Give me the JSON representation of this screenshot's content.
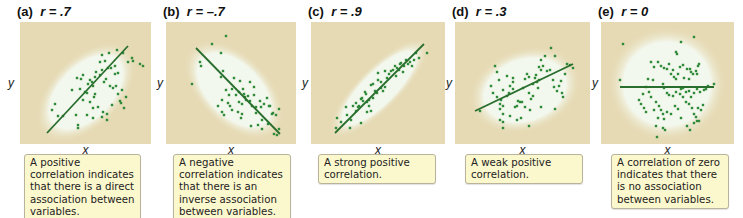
{
  "colors": {
    "plot_background": "#e6dab4",
    "cloud": "#f3f8ee",
    "points": "#2f8a3a",
    "line": "#2a6e2e",
    "caption_fill": "#fcf8cd",
    "caption_border": "#b8b39a"
  },
  "axis_labels": {
    "x": "x",
    "y": "y"
  },
  "chart_data": [
    {
      "type": "scatter",
      "title": "(a) r = .7",
      "panel_label": "(a)",
      "r_label": "r = .7",
      "xlabel": "x",
      "ylabel": "y",
      "grid": false,
      "caption": "A positive correlation indicates that there is a direct association between variables.",
      "trend_line": {
        "x1": 27,
        "y1": 111,
        "x2": 108,
        "y2": 24
      },
      "cloud": {
        "cx": 66,
        "cy": 70,
        "rx": 62,
        "ry": 36,
        "rotate": -45
      },
      "points": [
        [
          32,
          88
        ],
        [
          35,
          82
        ],
        [
          38,
          94
        ],
        [
          43,
          94
        ],
        [
          56,
          93
        ],
        [
          58,
          103
        ],
        [
          58,
          106
        ],
        [
          63,
          78
        ],
        [
          67,
          71
        ],
        [
          70,
          80
        ],
        [
          73,
          86
        ],
        [
          74,
          75
        ],
        [
          75,
          72
        ],
        [
          72,
          60
        ],
        [
          73,
          64
        ],
        [
          70,
          58
        ],
        [
          68,
          62
        ],
        [
          75,
          55
        ],
        [
          76,
          50
        ],
        [
          80,
          53
        ],
        [
          82,
          48
        ],
        [
          84,
          60
        ],
        [
          86,
          57
        ],
        [
          80,
          40
        ],
        [
          85,
          39
        ],
        [
          88,
          46
        ],
        [
          91,
          46
        ],
        [
          95,
          52
        ],
        [
          98,
          51
        ],
        [
          90,
          64
        ],
        [
          93,
          66
        ],
        [
          96,
          64
        ],
        [
          98,
          72
        ],
        [
          100,
          79
        ],
        [
          101,
          81
        ],
        [
          104,
          86
        ],
        [
          82,
          33
        ],
        [
          89,
          31
        ],
        [
          97,
          28
        ],
        [
          103,
          31
        ],
        [
          108,
          40
        ],
        [
          112,
          36
        ],
        [
          113,
          39
        ],
        [
          120,
          42
        ],
        [
          123,
          44
        ],
        [
          92,
          83
        ],
        [
          87,
          92
        ],
        [
          82,
          95
        ],
        [
          87,
          98
        ],
        [
          60,
          67
        ],
        [
          65,
          70
        ],
        [
          52,
          68
        ],
        [
          57,
          56
        ],
        [
          61,
          57
        ],
        [
          63,
          53
        ],
        [
          78,
          85
        ],
        [
          83,
          90
        ],
        [
          95,
          44
        ],
        [
          102,
          68
        ],
        [
          106,
          75
        ],
        [
          67,
          93
        ],
        [
          73,
          96
        ]
      ]
    },
    {
      "type": "scatter",
      "title": "(b) r = -.7",
      "panel_label": "(b)",
      "r_label": "r = –.7",
      "xlabel": "x",
      "ylabel": "y",
      "grid": false,
      "caption": "A negative correlation indicates that there is an inverse association between variables.",
      "trend_line": {
        "x1": 30,
        "y1": 26,
        "x2": 114,
        "y2": 112
      },
      "cloud": {
        "cx": 68,
        "cy": 68,
        "rx": 62,
        "ry": 36,
        "rotate": 45
      },
      "points": [
        [
          26,
          62
        ],
        [
          60,
          14
        ],
        [
          46,
          22
        ],
        [
          55,
          31
        ],
        [
          34,
          40
        ],
        [
          35,
          44
        ],
        [
          57,
          49
        ],
        [
          55,
          55
        ],
        [
          68,
          56
        ],
        [
          74,
          59
        ],
        [
          66,
          67
        ],
        [
          73,
          70
        ],
        [
          77,
          67
        ],
        [
          78,
          72
        ],
        [
          79,
          75
        ],
        [
          82,
          74
        ],
        [
          80,
          78
        ],
        [
          84,
          79
        ],
        [
          88,
          73
        ],
        [
          86,
          84
        ],
        [
          90,
          85
        ],
        [
          95,
          85
        ],
        [
          101,
          76
        ],
        [
          103,
          84
        ],
        [
          104,
          84
        ],
        [
          106,
          92
        ],
        [
          107,
          91
        ],
        [
          110,
          93
        ],
        [
          113,
          87
        ],
        [
          96,
          98
        ],
        [
          92,
          103
        ],
        [
          96,
          107
        ],
        [
          102,
          102
        ],
        [
          111,
          113
        ],
        [
          113,
          107
        ],
        [
          108,
          112
        ],
        [
          60,
          68
        ],
        [
          63,
          73
        ],
        [
          70,
          73
        ],
        [
          73,
          80
        ],
        [
          76,
          82
        ],
        [
          72,
          90
        ],
        [
          76,
          92
        ],
        [
          75,
          96
        ],
        [
          85,
          104
        ],
        [
          64,
          84
        ],
        [
          66,
          88
        ],
        [
          56,
          90
        ],
        [
          58,
          93
        ],
        [
          52,
          84
        ],
        [
          56,
          78
        ],
        [
          62,
          81
        ],
        [
          84,
          60
        ],
        [
          88,
          65
        ],
        [
          98,
          82
        ],
        [
          90,
          91
        ],
        [
          94,
          79
        ]
      ]
    },
    {
      "type": "scatter",
      "title": "(c) r = .9",
      "panel_label": "(c)",
      "r_label": "r = .9",
      "xlabel": "x",
      "ylabel": "y",
      "grid": false,
      "caption": "A strong positive correlation.",
      "trend_line": {
        "x1": 24,
        "y1": 111,
        "x2": 113,
        "y2": 22
      },
      "cloud": {
        "cx": 68,
        "cy": 66,
        "rx": 68,
        "ry": 22,
        "rotate": -45
      },
      "points": [
        [
          25,
          106
        ],
        [
          26,
          96
        ],
        [
          36,
          93
        ],
        [
          35,
          85
        ],
        [
          40,
          98
        ],
        [
          42,
          84
        ],
        [
          45,
          89
        ],
        [
          45,
          81
        ],
        [
          47,
          85
        ],
        [
          48,
          84
        ],
        [
          50,
          77
        ],
        [
          51,
          76
        ],
        [
          52,
          79
        ],
        [
          54,
          70
        ],
        [
          55,
          72
        ],
        [
          56,
          80
        ],
        [
          58,
          78
        ],
        [
          58,
          84
        ],
        [
          60,
          89
        ],
        [
          60,
          63
        ],
        [
          62,
          62
        ],
        [
          64,
          69
        ],
        [
          66,
          71
        ],
        [
          67,
          58
        ],
        [
          70,
          60
        ],
        [
          70,
          66
        ],
        [
          72,
          69
        ],
        [
          74,
          65
        ],
        [
          76,
          56
        ],
        [
          78,
          52
        ],
        [
          80,
          49
        ],
        [
          82,
          48
        ],
        [
          84,
          44
        ],
        [
          85,
          54
        ],
        [
          86,
          46
        ],
        [
          88,
          48
        ],
        [
          89,
          42
        ],
        [
          90,
          41
        ],
        [
          92,
          50
        ],
        [
          93,
          44
        ],
        [
          95,
          38
        ],
        [
          97,
          42
        ],
        [
          99,
          40
        ],
        [
          101,
          44
        ],
        [
          103,
          38
        ],
        [
          105,
          31
        ],
        [
          108,
          36
        ],
        [
          116,
          31
        ],
        [
          74,
          49
        ],
        [
          67,
          51
        ],
        [
          56,
          90
        ],
        [
          50,
          101
        ],
        [
          30,
          100
        ],
        [
          39,
          106
        ],
        [
          62,
          76
        ]
      ]
    },
    {
      "type": "scatter",
      "title": "(d) r = .3",
      "panel_label": "(d)",
      "r_label": "r = .3",
      "xlabel": "x",
      "ylabel": "y",
      "grid": false,
      "caption": "A weak positive correlation.",
      "trend_line": {
        "x1": 20,
        "y1": 89,
        "x2": 118,
        "y2": 42
      },
      "cloud": {
        "cx": 70,
        "cy": 68,
        "rx": 58,
        "ry": 42,
        "rotate": -20
      },
      "points": [
        [
          25,
          89
        ],
        [
          38,
          71
        ],
        [
          42,
          75
        ],
        [
          45,
          82
        ],
        [
          46,
          78
        ],
        [
          48,
          84
        ],
        [
          48,
          92
        ],
        [
          45,
          98
        ],
        [
          48,
          100
        ],
        [
          52,
          74
        ],
        [
          54,
          71
        ],
        [
          55,
          64
        ],
        [
          58,
          67
        ],
        [
          58,
          56
        ],
        [
          62,
          84
        ],
        [
          63,
          79
        ],
        [
          65,
          80
        ],
        [
          67,
          80
        ],
        [
          70,
          85
        ],
        [
          68,
          66
        ],
        [
          70,
          57
        ],
        [
          72,
          52
        ],
        [
          74,
          55
        ],
        [
          74,
          71
        ],
        [
          76,
          77
        ],
        [
          78,
          74
        ],
        [
          78,
          62
        ],
        [
          80,
          56
        ],
        [
          81,
          53
        ],
        [
          82,
          60
        ],
        [
          83,
          66
        ],
        [
          84,
          58
        ],
        [
          86,
          48
        ],
        [
          84,
          45
        ],
        [
          86,
          38
        ],
        [
          88,
          44
        ],
        [
          90,
          34
        ],
        [
          92,
          49
        ],
        [
          95,
          48
        ],
        [
          98,
          58
        ],
        [
          99,
          65
        ],
        [
          102,
          69
        ],
        [
          104,
          64
        ],
        [
          106,
          59
        ],
        [
          107,
          71
        ],
        [
          108,
          75
        ],
        [
          110,
          52
        ],
        [
          112,
          42
        ],
        [
          115,
          43
        ],
        [
          118,
          46
        ],
        [
          100,
          87
        ],
        [
          86,
          85
        ],
        [
          75,
          88
        ],
        [
          60,
          85
        ],
        [
          55,
          94
        ],
        [
          62,
          98
        ],
        [
          66,
          96
        ],
        [
          58,
          60
        ],
        [
          52,
          54
        ],
        [
          44,
          58
        ],
        [
          40,
          44
        ],
        [
          42,
          50
        ],
        [
          36,
          64
        ],
        [
          45,
          87
        ],
        [
          48,
          106
        ],
        [
          74,
          104
        ],
        [
          100,
          34
        ],
        [
          96,
          26
        ],
        [
          48,
          68
        ]
      ]
    },
    {
      "type": "scatter",
      "title": "(e) r = 0",
      "panel_label": "(e)",
      "r_label": "r = 0",
      "xlabel": "x",
      "ylabel": "y",
      "grid": false,
      "caption": "A correlation of zero indicates that there is no association between variables.",
      "trend_line": {
        "x1": 19,
        "y1": 65,
        "x2": 113,
        "y2": 65
      },
      "cloud": {
        "cx": 66,
        "cy": 62,
        "rx": 60,
        "ry": 58,
        "rotate": 0
      },
      "points": [
        [
          22,
          22
        ],
        [
          19,
          58
        ],
        [
          113,
          62
        ],
        [
          80,
          20
        ],
        [
          93,
          15
        ],
        [
          75,
          30
        ],
        [
          76,
          32
        ],
        [
          50,
          40
        ],
        [
          53,
          45
        ],
        [
          57,
          40
        ],
        [
          60,
          44
        ],
        [
          63,
          46
        ],
        [
          66,
          47
        ],
        [
          68,
          42
        ],
        [
          72,
          48
        ],
        [
          70,
          52
        ],
        [
          73,
          55
        ],
        [
          75,
          57
        ],
        [
          77,
          52
        ],
        [
          79,
          45
        ],
        [
          82,
          43
        ],
        [
          86,
          47
        ],
        [
          89,
          47
        ],
        [
          90,
          50
        ],
        [
          92,
          52
        ],
        [
          95,
          49
        ],
        [
          96,
          52
        ],
        [
          97,
          44
        ],
        [
          98,
          42
        ],
        [
          83,
          56
        ],
        [
          88,
          57
        ],
        [
          82,
          66
        ],
        [
          85,
          70
        ],
        [
          88,
          69
        ],
        [
          90,
          75
        ],
        [
          93,
          71
        ],
        [
          96,
          67
        ],
        [
          99,
          70
        ],
        [
          103,
          68
        ],
        [
          105,
          67
        ],
        [
          107,
          64
        ],
        [
          62,
          62
        ],
        [
          63,
          66
        ],
        [
          66,
          71
        ],
        [
          68,
          73
        ],
        [
          72,
          74
        ],
        [
          75,
          70
        ],
        [
          79,
          72
        ],
        [
          80,
          67
        ],
        [
          82,
          75
        ],
        [
          85,
          80
        ],
        [
          88,
          82
        ],
        [
          91,
          86
        ],
        [
          93,
          92
        ],
        [
          95,
          95
        ],
        [
          97,
          86
        ],
        [
          100,
          88
        ],
        [
          102,
          83
        ],
        [
          96,
          99
        ],
        [
          93,
          101
        ],
        [
          98,
          99
        ],
        [
          45,
          65
        ],
        [
          48,
          70
        ],
        [
          50,
          75
        ],
        [
          55,
          80
        ],
        [
          58,
          84
        ],
        [
          60,
          88
        ],
        [
          62,
          92
        ],
        [
          66,
          90
        ],
        [
          53,
          88
        ],
        [
          57,
          96
        ],
        [
          55,
          104
        ],
        [
          62,
          106
        ],
        [
          64,
          108
        ],
        [
          56,
          115
        ],
        [
          40,
          82
        ],
        [
          43,
          86
        ],
        [
          45,
          90
        ],
        [
          38,
          78
        ],
        [
          63,
          97
        ],
        [
          70,
          92
        ],
        [
          74,
          84
        ],
        [
          77,
          87
        ],
        [
          80,
          96
        ],
        [
          86,
          104
        ],
        [
          89,
          108
        ],
        [
          42,
          72
        ],
        [
          52,
          58
        ],
        [
          47,
          57
        ]
      ]
    }
  ]
}
